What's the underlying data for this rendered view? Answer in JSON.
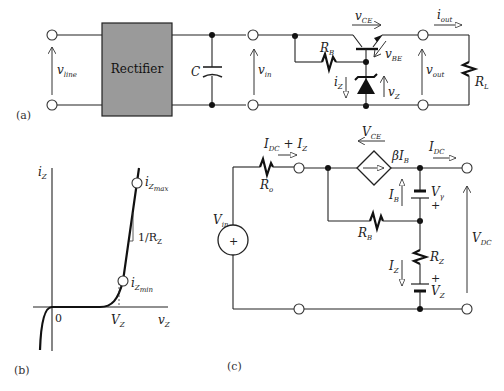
{
  "figure_a": {
    "caption": "(a)",
    "block_label": "Rectifier",
    "block_color": "#9a9a9a",
    "labels": {
      "v_line": "v",
      "v_line_sub": "line",
      "capacitor": "C",
      "v_in": "v",
      "v_in_sub": "in",
      "v_ce": "v",
      "v_ce_sub": "CE",
      "r_b": "R",
      "r_b_sub": "B",
      "v_be": "v",
      "v_be_sub": "BE",
      "i_z": "i",
      "i_z_sub": "Z",
      "v_z": "v",
      "v_z_sub": "Z",
      "v_out": "v",
      "v_out_sub": "out",
      "i_out": "i",
      "i_out_sub": "out",
      "r_l": "R",
      "r_l_sub": "L"
    }
  },
  "figure_b": {
    "caption": "(b)",
    "labels": {
      "y_axis": "i",
      "y_axis_sub": "Z",
      "x_axis": "v",
      "x_axis_sub": "Z",
      "origin": "0",
      "vz": "V",
      "vz_sub": "Z",
      "iz_max": "i",
      "iz_max_sub": "Z",
      "iz_max_subsub": "max",
      "iz_min": "i",
      "iz_min_sub": "Z",
      "iz_min_subsub": "min",
      "slope": "1/R",
      "slope_sub": "Z"
    }
  },
  "figure_c": {
    "caption": "(c)",
    "labels": {
      "idc_plus_iz": "I",
      "idc_sub": "DC",
      "plus": " + ",
      "iz2": "I",
      "iz2_sub": "Z",
      "v_ce": "V",
      "v_ce_sub": "CE",
      "beta_ib": "βI",
      "beta_ib_sub": "B",
      "idc": "I",
      "idc_sub2": "DC",
      "r_o": "R",
      "r_o_sub": "o",
      "v_in": "V",
      "v_in_sub": "in",
      "i_b": "I",
      "i_b_sub": "B",
      "v_gamma": "V",
      "v_gamma_sub": "γ",
      "plus1": "+",
      "r_b": "R",
      "r_b_sub": "B",
      "v_dc": "V",
      "v_dc_sub": "DC",
      "i_z": "I",
      "i_z_sub": "Z",
      "r_z": "R",
      "r_z_sub": "Z",
      "plus2": "+",
      "v_z": "V",
      "v_z_sub": "Z",
      "source_plus": "+"
    }
  }
}
